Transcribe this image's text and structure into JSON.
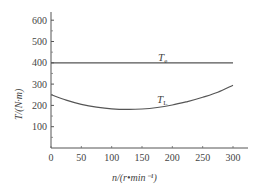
{
  "chart_data": {
    "type": "line",
    "title": "",
    "xlabel": "n/(r•min⁻¹)",
    "ylabel": "T/(N·m)",
    "xlim": [
      0,
      300
    ],
    "ylim": [
      0,
      650
    ],
    "xticks": [
      0,
      50,
      100,
      150,
      200,
      250,
      300
    ],
    "yticks": [
      100,
      200,
      300,
      400,
      500,
      600
    ],
    "grid": false,
    "legend": "inline labels",
    "series": [
      {
        "name": "T_e",
        "label_main": "T",
        "label_sub": "e",
        "x": [
          0,
          50,
          100,
          150,
          200,
          250,
          300
        ],
        "values": [
          400,
          400,
          400,
          400,
          400,
          400,
          400
        ]
      },
      {
        "name": "T_L",
        "label_main": "T",
        "label_sub": "L",
        "x": [
          0,
          25,
          50,
          75,
          100,
          125,
          150,
          175,
          200,
          225,
          250,
          275,
          300
        ],
        "values": [
          250,
          225,
          205,
          192,
          184,
          181,
          183,
          190,
          202,
          218,
          238,
          262,
          295
        ]
      }
    ]
  }
}
